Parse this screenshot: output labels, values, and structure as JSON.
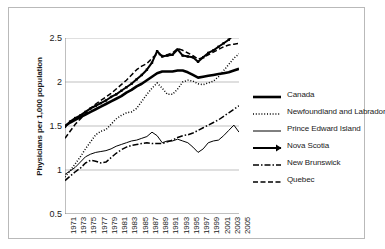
{
  "chart_data": {
    "type": "line",
    "title": "",
    "xlabel": "",
    "ylabel": "Physicians per 1,000 population",
    "ylim": [
      0.5,
      2.5
    ],
    "yticks": [
      "0.5",
      "1",
      "1.5",
      "2",
      "2.5"
    ],
    "ytick_values": [
      0.5,
      1.0,
      1.5,
      2.0,
      2.5
    ],
    "grid": true,
    "legend_position": "right",
    "x": [
      1971,
      1972,
      1973,
      1974,
      1975,
      1976,
      1977,
      1978,
      1979,
      1980,
      1981,
      1982,
      1983,
      1984,
      1985,
      1986,
      1987,
      1988,
      1989,
      1990,
      1991,
      1992,
      1993,
      1994,
      1995,
      1996,
      1997,
      1998,
      1999,
      2000,
      2001,
      2002,
      2003,
      2004,
      2005
    ],
    "xtick_labels": [
      "1971",
      "1973",
      "1975",
      "1977",
      "1979",
      "1981",
      "1983",
      "1985",
      "1987",
      "1989",
      "1991",
      "1993",
      "1995",
      "1997",
      "1999",
      "2001",
      "2003",
      "2005"
    ],
    "series": [
      {
        "name": "Canada",
        "style": "solid-thick",
        "values": [
          1.5,
          1.54,
          1.57,
          1.6,
          1.63,
          1.66,
          1.69,
          1.72,
          1.75,
          1.78,
          1.81,
          1.84,
          1.88,
          1.91,
          1.95,
          1.98,
          2.02,
          2.06,
          2.1,
          2.12,
          2.12,
          2.12,
          2.13,
          2.13,
          2.11,
          2.08,
          2.05,
          2.06,
          2.07,
          2.08,
          2.09,
          2.1,
          2.11,
          2.13,
          2.15
        ]
      },
      {
        "name": "Newfoundland and Labrador",
        "style": "dotted",
        "values": [
          0.92,
          0.99,
          1.07,
          1.15,
          1.24,
          1.32,
          1.4,
          1.44,
          1.46,
          1.52,
          1.58,
          1.62,
          1.65,
          1.66,
          1.7,
          1.78,
          1.86,
          1.93,
          1.99,
          1.93,
          1.86,
          1.86,
          1.92,
          2.0,
          2.02,
          2.01,
          1.98,
          1.97,
          1.99,
          2.01,
          2.06,
          2.13,
          2.2,
          2.27,
          2.32
        ]
      },
      {
        "name": "Prince Edward Island",
        "style": "solid-thin",
        "values": [
          0.95,
          0.99,
          1.03,
          1.09,
          1.15,
          1.18,
          1.2,
          1.21,
          1.22,
          1.24,
          1.27,
          1.29,
          1.31,
          1.33,
          1.34,
          1.36,
          1.38,
          1.43,
          1.39,
          1.31,
          1.33,
          1.33,
          1.35,
          1.33,
          1.31,
          1.26,
          1.2,
          1.24,
          1.31,
          1.33,
          1.34,
          1.39,
          1.45,
          1.51,
          1.43
        ]
      },
      {
        "name": "Nova Scotia",
        "style": "solid-thick-marker",
        "values": [
          1.49,
          1.55,
          1.59,
          1.62,
          1.66,
          1.7,
          1.73,
          1.76,
          1.79,
          1.83,
          1.86,
          1.9,
          1.94,
          1.98,
          2.03,
          2.08,
          2.14,
          2.22,
          2.35,
          2.29,
          2.3,
          2.31,
          2.37,
          2.3,
          2.29,
          2.28,
          2.23,
          2.28,
          2.33,
          2.36,
          2.4,
          2.44,
          2.48,
          2.54,
          2.6
        ]
      },
      {
        "name": "New Brunswick",
        "style": "dash-dot",
        "values": [
          0.88,
          0.93,
          0.98,
          1.02,
          1.08,
          1.11,
          1.1,
          1.08,
          1.09,
          1.14,
          1.19,
          1.23,
          1.26,
          1.28,
          1.29,
          1.3,
          1.31,
          1.3,
          1.3,
          1.3,
          1.32,
          1.34,
          1.37,
          1.39,
          1.4,
          1.42,
          1.45,
          1.48,
          1.51,
          1.54,
          1.57,
          1.61,
          1.65,
          1.69,
          1.73
        ]
      },
      {
        "name": "Quebec",
        "style": "dashed",
        "values": [
          1.36,
          1.44,
          1.52,
          1.58,
          1.64,
          1.7,
          1.75,
          1.79,
          1.83,
          1.87,
          1.92,
          1.97,
          2.02,
          2.08,
          2.14,
          2.18,
          2.21,
          2.27,
          2.32,
          2.3,
          2.31,
          2.33,
          2.38,
          2.36,
          2.33,
          2.3,
          2.26,
          2.28,
          2.31,
          2.34,
          2.37,
          2.4,
          2.42,
          2.43,
          2.44
        ]
      }
    ]
  },
  "legend": {
    "items": [
      {
        "label": "Canada"
      },
      {
        "label": "Newfoundland and Labrador"
      },
      {
        "label": "Prince Edward Island"
      },
      {
        "label": "Nova Scotia"
      },
      {
        "label": "New Brunswick"
      },
      {
        "label": "Quebec"
      }
    ]
  },
  "colors": {
    "series": "#000000",
    "grid": "#bfbfbf",
    "axis": "#808080",
    "frame": "#b9b9b9",
    "text": "#1a1a1a"
  }
}
